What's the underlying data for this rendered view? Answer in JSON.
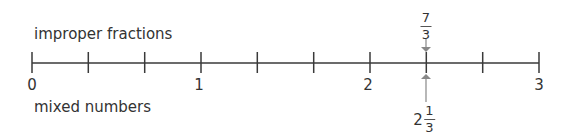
{
  "labels": {
    "top": "improper fractions",
    "bottom": "mixed numbers"
  },
  "number_line": {
    "min": 0,
    "max": 3,
    "divisions_per_unit": 3,
    "tick_labels": [
      "0",
      "1",
      "2",
      "3"
    ]
  },
  "marker": {
    "value": 2.3333,
    "improper": {
      "numerator": "7",
      "denominator": "3"
    },
    "mixed": {
      "whole": "2",
      "numerator": "1",
      "denominator": "3"
    },
    "arrow_color": "#888888"
  },
  "colors": {
    "line": "#3a3a3a",
    "text": "#333333"
  }
}
